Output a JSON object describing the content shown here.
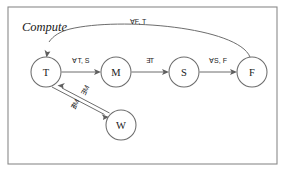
{
  "figure": {
    "title": "Compute",
    "frame": {
      "x": 8,
      "y": 7,
      "width": 269,
      "height": 157,
      "stroke": "#8a8a8a"
    },
    "background": "#ffffff",
    "ink": "#6d6d6d"
  },
  "graph": {
    "type": "state-transition-diagram",
    "nodes": [
      {
        "id": "T",
        "label": "T",
        "cx": 46,
        "cy": 72,
        "r": 15
      },
      {
        "id": "M",
        "label": "M",
        "cx": 116,
        "cy": 72,
        "r": 15
      },
      {
        "id": "S",
        "label": "S",
        "cx": 184,
        "cy": 72,
        "r": 15
      },
      {
        "id": "F",
        "label": "F",
        "cx": 252,
        "cy": 72,
        "r": 15
      },
      {
        "id": "W",
        "label": "W",
        "cx": 121,
        "cy": 125,
        "r": 15
      }
    ],
    "edges": [
      {
        "id": "t-m",
        "from": "T",
        "to": "M",
        "label": "∀T, S",
        "label_x": 81,
        "label_y": 60,
        "shape": "straight"
      },
      {
        "id": "m-s",
        "from": "M",
        "to": "S",
        "label": "∃T",
        "label_x": 150,
        "label_y": 60,
        "shape": "straight"
      },
      {
        "id": "s-f",
        "from": "S",
        "to": "F",
        "label": "∀S, F",
        "label_x": 218,
        "label_y": 60,
        "shape": "straight"
      },
      {
        "id": "f-t",
        "from": "F",
        "to": "T",
        "label": "∀F, T",
        "label_x": 138,
        "label_y": 21,
        "shape": "arc-over"
      },
      {
        "id": "w-t",
        "from": "W",
        "to": "T",
        "label": "∃M",
        "label_x": 85,
        "label_y": 90,
        "label_rotate": 38,
        "shape": "straight"
      },
      {
        "id": "t-w",
        "from": "T",
        "to": "W",
        "label": "∄M",
        "label_x": 75,
        "label_y": 104,
        "label_rotate": 38,
        "shape": "straight"
      }
    ]
  },
  "icons": {
    "arrow": "arrow-head-icon"
  }
}
